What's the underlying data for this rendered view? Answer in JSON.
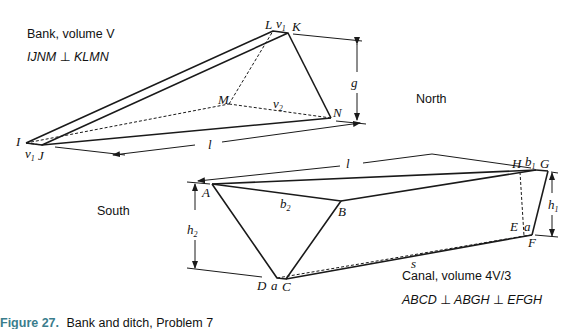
{
  "labels": {
    "bank_title": "Bank, volume V",
    "bank_relation": "IJNM ⊥ KLMN",
    "north": "North",
    "south": "South",
    "canal_title": "Canal, volume 4V/3",
    "canal_relation": "ABCD ⊥ ABGH ⊥ EFGH",
    "caption_prefix": "Figure 27.",
    "caption_text": "Bank and ditch, Problem 7"
  },
  "bank_points": {
    "I": "I",
    "J": "J",
    "K": "K",
    "L": "L",
    "M": "M",
    "N": "N",
    "v1_top": "v",
    "v1_top_sub": "1",
    "v1_bottom": "v",
    "v1_bottom_sub": "1",
    "v2": "v",
    "v2_sub": "2",
    "g": "g",
    "l": "l"
  },
  "canal_points": {
    "A": "A",
    "B": "B",
    "C": "C",
    "D": "D",
    "E": "E",
    "F": "F",
    "G": "G",
    "H": "H",
    "a_bottom": "a",
    "a_right": "a",
    "b1": "b",
    "b1_sub": "1",
    "b2": "b",
    "b2_sub": "2",
    "h1": "h",
    "h1_sub": "1",
    "h2": "h",
    "h2_sub": "2",
    "l": "l",
    "s": "s"
  }
}
